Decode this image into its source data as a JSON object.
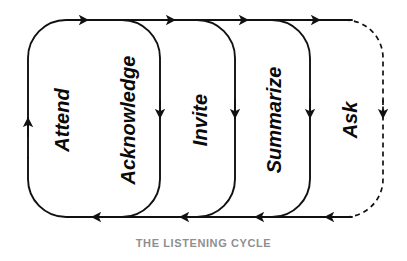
{
  "diagram": {
    "title": "THE LISTENING CYCLE",
    "type": "cycle-flow",
    "caption": {
      "text": "THE LISTENING CYCLE",
      "color": "#8f8f8f",
      "font_size_px": 11,
      "x": 203,
      "y": 243
    },
    "canvas": {
      "width": 407,
      "height": 261,
      "background": "#ffffff"
    },
    "style": {
      "line_color": "#111111",
      "solid_stroke_width": 1.9,
      "dashed_stroke_width": 1.7,
      "dash_pattern": "5,4",
      "corner_radius": 38,
      "top_rail_y": 20,
      "bottom_rail_y": 217,
      "label_color": "#0a0a0a",
      "label_rotation_deg": -90
    },
    "stages": [
      {
        "id": "attend",
        "label": "Attend",
        "order": 1,
        "dashed": false,
        "font_size_px": 20,
        "label_x": 62,
        "label_y": 120,
        "left_x": 28,
        "right_x": 160
      },
      {
        "id": "acknowledge",
        "label": "Acknowledge",
        "order": 2,
        "dashed": false,
        "font_size_px": 20,
        "label_x": 128,
        "label_y": 120,
        "left_x": 90,
        "right_x": 160
      },
      {
        "id": "invite",
        "label": "Invite",
        "order": 3,
        "dashed": false,
        "font_size_px": 20,
        "label_x": 200,
        "label_y": 120,
        "left_x": 168,
        "right_x": 235
      },
      {
        "id": "summarize",
        "label": "Summarize",
        "order": 4,
        "dashed": false,
        "font_size_px": 20,
        "label_x": 274,
        "label_y": 120,
        "left_x": 243,
        "right_x": 310
      },
      {
        "id": "ask",
        "label": "Ask",
        "order": 5,
        "dashed": true,
        "font_size_px": 20,
        "label_x": 350,
        "label_y": 120,
        "left_x": 318,
        "right_x": 383
      }
    ],
    "arrows": {
      "top_direction": "right",
      "bottom_direction": "left",
      "left_edge_direction": "up",
      "separator_direction": "down",
      "top_marker_x": [
        88,
        175,
        248,
        320
      ],
      "bottom_marker_x": [
        92,
        180,
        255,
        325
      ],
      "separator_marker_x": [
        160,
        235,
        310,
        383
      ],
      "separator_marker_y": 118,
      "left_marker_y": 120,
      "left_marker_x": 28
    }
  }
}
